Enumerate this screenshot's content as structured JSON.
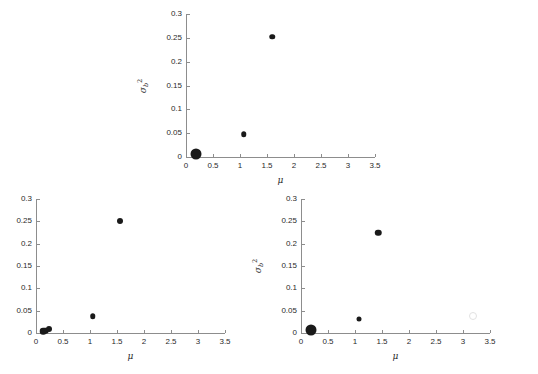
{
  "figure": {
    "background": "#ffffff",
    "marker_color": "#1a1a1a",
    "axis_color": "#8d8d8d",
    "text_color": "#2b2b2b"
  },
  "axis": {
    "x_label": "μ",
    "y_symbol": "σ",
    "y_sub": "b",
    "y_sup": "2",
    "x_ticks": [
      "0",
      "0.5",
      "1",
      "1.5",
      "2",
      "2.5",
      "3",
      "3.5"
    ],
    "y_ticks": [
      "0",
      "0.05",
      "0.1",
      "0.15",
      "0.2",
      "0.25",
      "0.3"
    ],
    "xlim": [
      0,
      3.5
    ],
    "ylim": [
      0,
      0.3
    ]
  },
  "chart_data": [
    {
      "type": "scatter",
      "name": "top-panel",
      "title": "",
      "xlabel": "μ",
      "ylabel": "σ_b²",
      "xlim": [
        0,
        3.5
      ],
      "ylim": [
        0,
        0.3
      ],
      "xticks": [
        0,
        0.5,
        1,
        1.5,
        2,
        2.5,
        3,
        3.5
      ],
      "yticks": [
        0,
        0.05,
        0.1,
        0.15,
        0.2,
        0.25,
        0.3
      ],
      "grid": false,
      "legend": "none",
      "points": [
        {
          "x": 0.19,
          "y": 0.007,
          "size": 11
        },
        {
          "x": 1.07,
          "y": 0.048,
          "size": 5.5
        },
        {
          "x": 1.6,
          "y": 0.252,
          "size": 5.5
        }
      ]
    },
    {
      "type": "scatter",
      "name": "bottom-left-panel",
      "title": "",
      "xlabel": "μ",
      "ylabel": "σ_b²",
      "xlim": [
        0,
        3.5
      ],
      "ylim": [
        0,
        0.3
      ],
      "xticks": [
        0,
        0.5,
        1,
        1.5,
        2,
        2.5,
        3,
        3.5
      ],
      "yticks": [
        0,
        0.05,
        0.1,
        0.15,
        0.2,
        0.25,
        0.3
      ],
      "grid": false,
      "legend": "none",
      "points": [
        {
          "x": 0.13,
          "y": 0.004,
          "size": 6.5
        },
        {
          "x": 0.17,
          "y": 0.005,
          "size": 6.5
        },
        {
          "x": 0.24,
          "y": 0.008,
          "size": 6
        },
        {
          "x": 1.05,
          "y": 0.037,
          "size": 5.5
        },
        {
          "x": 1.55,
          "y": 0.25,
          "size": 6
        }
      ]
    },
    {
      "type": "scatter",
      "name": "bottom-right-panel",
      "title": "",
      "xlabel": "μ",
      "ylabel": "σ_b²",
      "xlim": [
        0,
        3.5
      ],
      "ylim": [
        0,
        0.3
      ],
      "xticks": [
        0,
        0.5,
        1,
        1.5,
        2,
        2.5,
        3,
        3.5
      ],
      "yticks": [
        0,
        0.05,
        0.1,
        0.15,
        0.2,
        0.25,
        0.3
      ],
      "grid": false,
      "legend": "none",
      "points": [
        {
          "x": 0.19,
          "y": 0.007,
          "size": 11
        },
        {
          "x": 1.07,
          "y": 0.032,
          "size": 5
        },
        {
          "x": 1.43,
          "y": 0.224,
          "size": 6.5
        }
      ],
      "faint_points": [
        {
          "x": 3.19,
          "y": 0.037,
          "size": 6
        }
      ]
    }
  ]
}
